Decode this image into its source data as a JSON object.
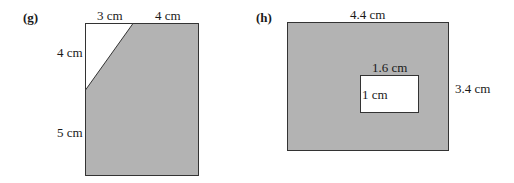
{
  "colors": {
    "fill": "#b3b3b3",
    "stroke": "#333333",
    "hole": "#ffffff"
  },
  "figure_g": {
    "label": "(g)",
    "top_left_segment": "3 cm",
    "top_right_segment": "4 cm",
    "left_upper_segment": "4 cm",
    "left_lower_segment": "5 cm"
  },
  "figure_h": {
    "label": "(h)",
    "outer_width": "4.4 cm",
    "outer_height": "3.4 cm",
    "inner_width": "1.6 cm",
    "inner_height": "1 cm"
  }
}
